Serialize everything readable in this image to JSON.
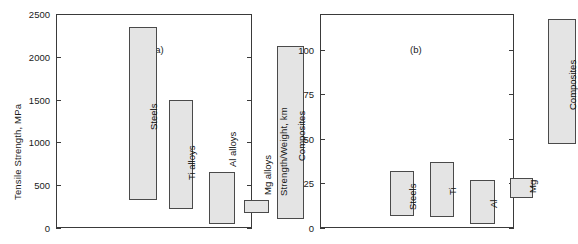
{
  "figure": {
    "panels": [
      {
        "tag": "(a)",
        "tag_x": 152,
        "tag_y": 44,
        "ylabel": "Tensile Strength, MPa",
        "yticks": [
          0,
          500,
          1000,
          1500,
          2000,
          2500
        ],
        "ymin": 0,
        "ymax": 2500,
        "bars": [
          {
            "label": "Steels",
            "low": 330,
            "high": 2350,
            "x": 73,
            "width": 28,
            "label_inside": true
          },
          {
            "label": "Ti alloys",
            "low": 220,
            "high": 1490,
            "x": 113,
            "width": 24,
            "label_inside": true
          },
          {
            "label": "Al alloys",
            "low": 50,
            "high": 660,
            "x": 153,
            "width": 26,
            "label_inside": false
          },
          {
            "label": "Mg alloys",
            "low": 180,
            "high": 330,
            "x": 188,
            "width": 25,
            "label_inside": false
          },
          {
            "label": "Composites",
            "low": 100,
            "high": 2130,
            "x": 221,
            "width": 27,
            "label_inside": true
          }
        ]
      },
      {
        "tag": "(b)",
        "tag_x": 148,
        "tag_y": 44,
        "ylabel": "Strength/Weight, km",
        "yticks": [
          0,
          25,
          50,
          75,
          100
        ],
        "ymin": 0,
        "ymax": 120,
        "bars": [
          {
            "label": "Steels",
            "low": 7,
            "high": 32,
            "x": 70,
            "width": 24,
            "label_inside": true
          },
          {
            "label": "Ti",
            "low": 6,
            "high": 37,
            "x": 110,
            "width": 24,
            "label_inside": true
          },
          {
            "label": "Al",
            "low": 2,
            "high": 27,
            "x": 150,
            "width": 25,
            "label_inside": true
          },
          {
            "label": "Mg",
            "low": 17,
            "high": 28,
            "x": 190,
            "width": 23,
            "label_inside": true
          },
          {
            "label": "Composites",
            "low": 47,
            "high": 117,
            "x": 228,
            "width": 28,
            "label_inside": true
          }
        ]
      }
    ]
  },
  "chart_data": [
    {
      "type": "bar",
      "subtype": "floating-range-bar",
      "title": "(a)",
      "xlabel": "",
      "ylabel": "Tensile Strength, MPa",
      "ylim": [
        0,
        2500
      ],
      "yticks": [
        0,
        500,
        1000,
        1500,
        2000,
        2500
      ],
      "grid": false,
      "legend": "none",
      "categories": [
        "Steels",
        "Ti alloys",
        "Al alloys",
        "Mg alloys",
        "Composites"
      ],
      "ranges": [
        [
          330,
          2350
        ],
        [
          220,
          1490
        ],
        [
          50,
          660
        ],
        [
          180,
          330
        ],
        [
          100,
          2130
        ]
      ],
      "series": [
        {
          "name": "minimum",
          "values": [
            330,
            220,
            50,
            180,
            100
          ]
        },
        {
          "name": "maximum",
          "values": [
            2350,
            1490,
            660,
            330,
            2130
          ]
        }
      ],
      "annotations": [
        "(a)"
      ]
    },
    {
      "type": "bar",
      "subtype": "floating-range-bar",
      "title": "(b)",
      "xlabel": "",
      "ylabel": "Strength/Weight, km",
      "ylim": [
        0,
        120
      ],
      "yticks": [
        0,
        25,
        50,
        75,
        100
      ],
      "grid": false,
      "legend": "none",
      "categories": [
        "Steels",
        "Ti",
        "Al",
        "Mg",
        "Composites"
      ],
      "ranges": [
        [
          7,
          32
        ],
        [
          6,
          37
        ],
        [
          2,
          27
        ],
        [
          17,
          28
        ],
        [
          47,
          117
        ]
      ],
      "series": [
        {
          "name": "minimum",
          "values": [
            7,
            6,
            2,
            17,
            47
          ]
        },
        {
          "name": "maximum",
          "values": [
            32,
            37,
            27,
            28,
            117
          ]
        }
      ],
      "annotations": [
        "(b)"
      ]
    }
  ]
}
